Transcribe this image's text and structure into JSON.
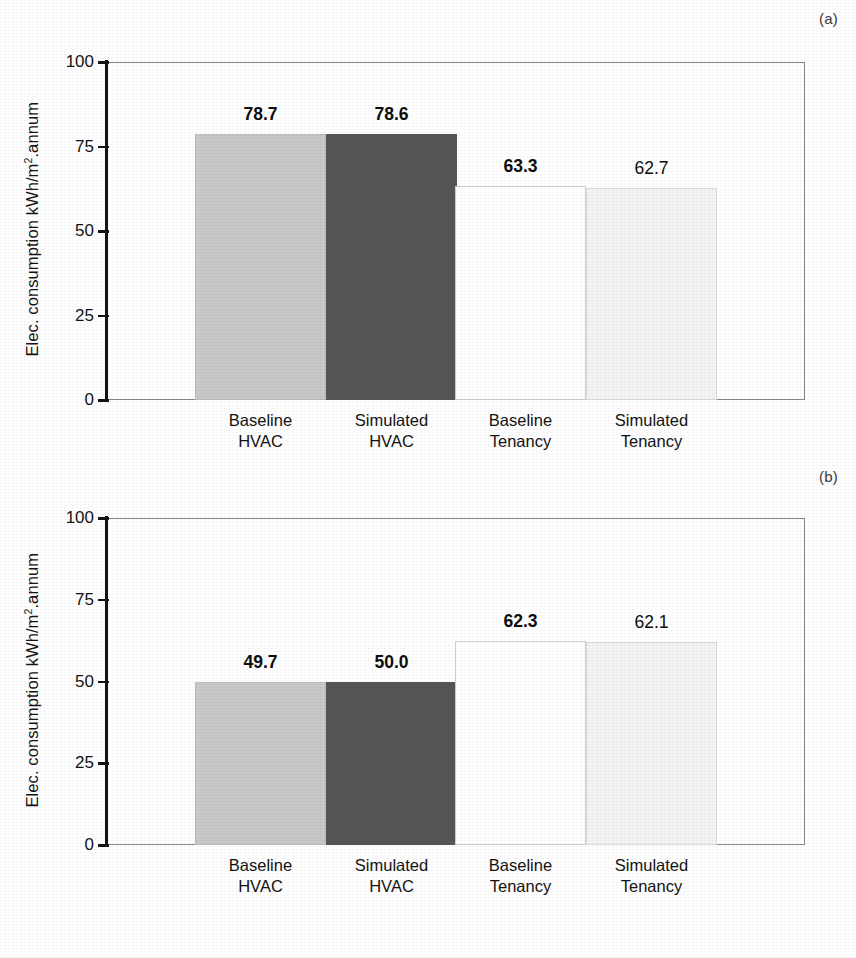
{
  "figure": {
    "panels": [
      {
        "tag": "(a)",
        "ylabel_main": "Elec. consumption kWh/m",
        "ylabel_sup": "2",
        "ylabel_tail": ".annum",
        "yticks": [
          "100",
          "75",
          "50",
          "25",
          "0"
        ],
        "categories": [
          {
            "line1": "Baseline",
            "line2": "HVAC"
          },
          {
            "line1": "Simulated",
            "line2": "HVAC"
          },
          {
            "line1": "Baseline",
            "line2": "Tenancy"
          },
          {
            "line1": "Simulated",
            "line2": "Tenancy"
          }
        ],
        "values": [
          "78.7",
          "78.6",
          "63.3",
          "62.7"
        ]
      },
      {
        "tag": "(b)",
        "ylabel_main": "Elec. consumption kWh/m",
        "ylabel_sup": "2",
        "ylabel_tail": ".annum",
        "yticks": [
          "100",
          "75",
          "50",
          "25",
          "0"
        ],
        "categories": [
          {
            "line1": "Baseline",
            "line2": "HVAC"
          },
          {
            "line1": "Simulated",
            "line2": "HVAC"
          },
          {
            "line1": "Baseline",
            "line2": "Tenancy"
          },
          {
            "line1": "Simulated",
            "line2": "Tenancy"
          }
        ],
        "values": [
          "49.7",
          "50.0",
          "62.3",
          "62.1"
        ]
      }
    ]
  },
  "chart_data": [
    {
      "type": "bar",
      "title": "(a)",
      "xlabel": "",
      "ylabel": "Elec. consumption kWh/m2.annum",
      "ylim": [
        0,
        100
      ],
      "yticks": [
        0,
        25,
        50,
        75,
        100
      ],
      "grid": false,
      "legend": "none",
      "categories": [
        "Baseline HVAC",
        "Simulated HVAC",
        "Baseline Tenancy",
        "Simulated Tenancy"
      ],
      "values": [
        78.7,
        78.6,
        63.3,
        62.7
      ],
      "bar_colors": [
        "#c9c9c9",
        "#565656",
        "#ffffff",
        "#f4f4f4"
      ],
      "label_weights": [
        "bold",
        "bold",
        "bold",
        "normal"
      ]
    },
    {
      "type": "bar",
      "title": "(b)",
      "xlabel": "",
      "ylabel": "Elec. consumption kWh/m2.annum",
      "ylim": [
        0,
        100
      ],
      "yticks": [
        0,
        25,
        50,
        75,
        100
      ],
      "grid": false,
      "legend": "none",
      "categories": [
        "Baseline HVAC",
        "Simulated HVAC",
        "Baseline Tenancy",
        "Simulated Tenancy"
      ],
      "values": [
        49.7,
        50.0,
        62.3,
        62.1
      ],
      "bar_colors": [
        "#c9c9c9",
        "#565656",
        "#ffffff",
        "#f4f4f4"
      ],
      "label_weights": [
        "bold",
        "bold",
        "bold",
        "normal"
      ]
    }
  ],
  "colors": {
    "bar_light": "#c9c9c9",
    "bar_dark": "#565656",
    "bar_white": "#ffffff",
    "bar_offwhite": "#f4f4f4",
    "axis": "#141414",
    "frame": "#8a8a8a"
  }
}
